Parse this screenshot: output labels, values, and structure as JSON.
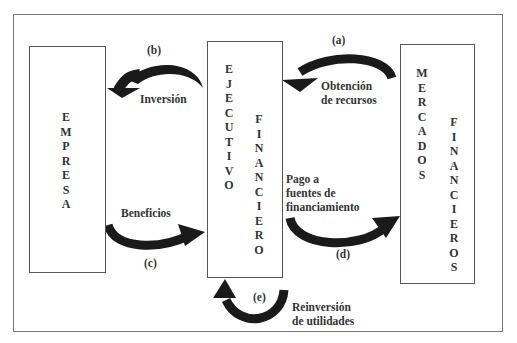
{
  "diagram": {
    "boxes": {
      "empresa": {
        "label": "EMPRESA"
      },
      "ejecutivo": {
        "label_left": "EJECUTIVO",
        "label_right": "FINANCIERO"
      },
      "mercados": {
        "label_left": "MERCADOS",
        "label_right": "FINANCIEROS"
      }
    },
    "flows": [
      {
        "id": "a",
        "tag": "(a)",
        "label": "Obtención de recursos",
        "label_lines": [
          "Obtención",
          "de recursos"
        ],
        "from": "MERCADOS FINANCIEROS",
        "to": "EJECUTIVO FINANCIERO"
      },
      {
        "id": "b",
        "tag": "(b)",
        "label": "Inversión",
        "label_lines": [
          "Inversión"
        ],
        "from": "EJECUTIVO FINANCIERO",
        "to": "EMPRESA"
      },
      {
        "id": "c",
        "tag": "(c)",
        "label": "Beneficios",
        "label_lines": [
          "Beneficios"
        ],
        "from": "EMPRESA",
        "to": "EJECUTIVO FINANCIERO"
      },
      {
        "id": "d",
        "tag": "(d)",
        "label": "Pago a fuentes de financiamiento",
        "label_lines": [
          "Pago a",
          "fuentes de",
          "financiamiento"
        ],
        "from": "EJECUTIVO FINANCIERO",
        "to": "MERCADOS FINANCIEROS"
      },
      {
        "id": "e",
        "tag": "(e)",
        "label": "Reinversión de utilidades",
        "label_lines": [
          "Reinversión",
          "de utilidades"
        ],
        "from": "EJECUTIVO FINANCIERO",
        "to": "EJECUTIVO FINANCIERO"
      }
    ],
    "colors": {
      "arrow": "#1a1a1a",
      "border": "#666666",
      "text": "#333333"
    }
  }
}
